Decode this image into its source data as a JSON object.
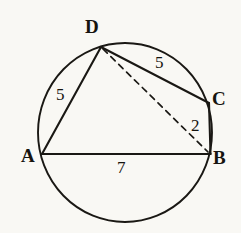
{
  "figure": {
    "kind": "cyclic-quadrilateral-in-circle",
    "stroke_color": "#1a1814",
    "background_color": "#f9f8f4"
  },
  "vertices": [
    {
      "id": "A",
      "label": "A",
      "x": 42,
      "y": 154,
      "label_x": 21,
      "label_y": 146
    },
    {
      "id": "B",
      "label": "B",
      "x": 210,
      "y": 154,
      "label_x": 213,
      "label_y": 148
    },
    {
      "id": "C",
      "label": "C",
      "x": 209,
      "y": 103,
      "label_x": 212,
      "label_y": 89
    },
    {
      "id": "D",
      "label": "D",
      "x": 101,
      "y": 47,
      "label_x": 85,
      "label_y": 17
    }
  ],
  "circle": {
    "center_x": 125,
    "center_y": 132.5,
    "radius_x": 87,
    "radius_y": 89.5
  },
  "segments": [
    {
      "id": "AD",
      "from": "A",
      "to": "D",
      "style": "solid"
    },
    {
      "id": "DC",
      "from": "D",
      "to": "C",
      "style": "solid"
    },
    {
      "id": "CB",
      "from": "C",
      "to": "B",
      "style": "solid"
    },
    {
      "id": "AB",
      "from": "A",
      "to": "B",
      "style": "solid"
    },
    {
      "id": "DB",
      "from": "D",
      "to": "B",
      "style": "dashed"
    }
  ],
  "length_labels": [
    {
      "id": "AD-length",
      "segment": "AD",
      "value": "5",
      "x": 56,
      "y": 86
    },
    {
      "id": "DC-length",
      "segment": "DC",
      "value": "5",
      "x": 155,
      "y": 54
    },
    {
      "id": "CB-length",
      "segment": "CB",
      "value": "2",
      "x": 191,
      "y": 117
    },
    {
      "id": "AB-length",
      "segment": "AB",
      "value": "7",
      "x": 117,
      "y": 159
    }
  ]
}
